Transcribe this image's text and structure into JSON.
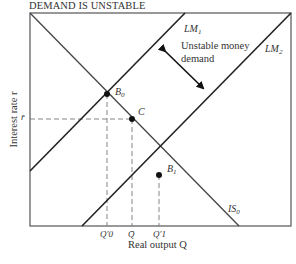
{
  "title": "DEMAND IS UNSTABLE",
  "axes": {
    "y_label": "Interest rate r",
    "x_label": "Real output Q",
    "y_tick": "r̄",
    "x_ticks": [
      "Q′0",
      "Q̄",
      "Q′1"
    ]
  },
  "curves": {
    "lm1": {
      "name": "LM",
      "sub": "1"
    },
    "lm2": {
      "name": "LM",
      "sub": "2"
    },
    "is0": {
      "name": "IS",
      "sub": "0"
    }
  },
  "points": {
    "b0": {
      "name": "B",
      "sub": "0"
    },
    "c": {
      "name": "C"
    },
    "b1": {
      "name": "B",
      "sub": "1"
    }
  },
  "annotation": {
    "line1": "Unstable money",
    "line2": "demand"
  },
  "colors": {
    "line": "#2a2a2a",
    "frame": "#555555",
    "dash": "#777777"
  }
}
